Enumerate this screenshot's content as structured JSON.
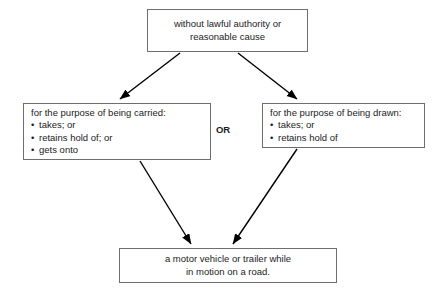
{
  "diagram": {
    "background_color": "#ffffff",
    "border_color": "#6e6e6e",
    "text_color": "#1c1c1c",
    "connector_color": "#000000",
    "connector_label": "OR",
    "nodes": {
      "top": {
        "lines": [
          "without lawful authority or",
          "reasonable cause"
        ]
      },
      "left": {
        "heading": "for the purpose of being carried:",
        "bullets": [
          "takes; or",
          "retains hold of; or",
          "gets onto"
        ]
      },
      "right": {
        "heading": "for the purpose of being drawn:",
        "bullets": [
          "takes; or",
          "retains hold of"
        ]
      },
      "bottom": {
        "lines": [
          "a motor vehicle or trailer while",
          "in motion on a road."
        ]
      }
    },
    "edges": [
      {
        "name": "top-to-left",
        "from": "top",
        "to": "left"
      },
      {
        "name": "top-to-right",
        "from": "top",
        "to": "right"
      },
      {
        "name": "left-to-bottom",
        "from": "left",
        "to": "bottom"
      },
      {
        "name": "right-to-bottom",
        "from": "right",
        "to": "bottom"
      }
    ]
  }
}
